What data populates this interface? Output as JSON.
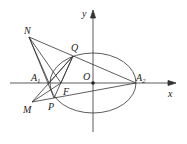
{
  "diagram": {
    "type": "geometry",
    "axes": {
      "x_label": "x",
      "y_label": "y",
      "origin_label": "O"
    },
    "points": {
      "N": {
        "label": "N",
        "x": 29,
        "y": 37
      },
      "Q": {
        "label": "Q",
        "x": 73,
        "y": 56
      },
      "A1": {
        "label": "A",
        "sub": "1",
        "x": 49,
        "y": 83
      },
      "F": {
        "label": "F",
        "x": 61,
        "y": 83
      },
      "O": {
        "label": "O",
        "x": 93,
        "y": 83
      },
      "A2": {
        "label": "A",
        "sub": "2",
        "x": 136,
        "y": 83
      },
      "M": {
        "label": "M",
        "x": 32,
        "y": 102
      },
      "P": {
        "label": "P",
        "x": 54,
        "y": 98
      }
    },
    "ellipse": {
      "cx": 93,
      "cy": 83,
      "rx": 43,
      "ry": 30
    },
    "segments": [
      [
        "N",
        "A2"
      ],
      [
        "N",
        "A1"
      ],
      [
        "N",
        "F"
      ],
      [
        "N",
        "P"
      ],
      [
        "Q",
        "A1"
      ],
      [
        "Q",
        "F"
      ],
      [
        "Q",
        "P"
      ],
      [
        "M",
        "Q"
      ],
      [
        "M",
        "A1"
      ],
      [
        "M",
        "F"
      ],
      [
        "M",
        "P"
      ],
      [
        "P",
        "A2"
      ],
      [
        "A1",
        "P"
      ]
    ]
  }
}
